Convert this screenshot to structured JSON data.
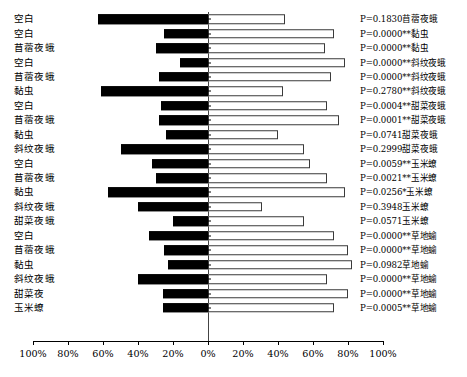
{
  "chart_data": {
    "type": "bar",
    "orientation": "horizontal",
    "subtype": "diverging-bidirectional",
    "title": "",
    "xlabel": "",
    "ylabel": "",
    "xlim": [
      -100,
      100
    ],
    "grid": false,
    "legend": "none",
    "axis_tick_labels": [
      "100%",
      "80%",
      "60%",
      "40%",
      "20%",
      "0%",
      "20%",
      "40%",
      "60%",
      "80%",
      "100%"
    ],
    "axis_tick_values": [
      -100,
      -80,
      -60,
      -40,
      -20,
      0,
      20,
      40,
      60,
      80,
      100
    ],
    "series": [
      {
        "name": "left-black",
        "color": "#000000"
      },
      {
        "name": "right-white",
        "color": "#ffffff"
      }
    ],
    "categories": [
      "空白",
      "空白",
      "苜蓿夜蛾",
      "空白",
      "苜蓿夜蛾",
      "黏虫",
      "空白",
      "苜蓿夜蛾",
      "黏虫",
      "斜纹夜蛾",
      "空白",
      "苜蓿夜蛾",
      "黏虫",
      "斜纹夜蛾",
      "甜菜夜蛾",
      "空白",
      "苜蓿夜蛾",
      "黏虫",
      "斜纹夜蛾",
      "甜菜夜",
      "玉米蟟"
    ],
    "annotations": [
      "P=0.1830苜蓿夜蛾",
      "P=0.0000**黏虫",
      "P=0.0000**黏虫",
      "P=0.0000**斜纹夜蛾",
      "P=0.0000**斜纹夜蛾",
      "P=0.2780**斜纹夜蛾",
      "P=0.0004**甜菜夜蛾",
      "P=0.0001**甜菜夜蛾",
      "P=0.0741甜菜夜蛾",
      "P=0.2999甜菜夜蛾",
      "P=0.0059**玉米蟟",
      "P=0.0021**玉米蟟",
      "P=0.0256*玉米蟟",
      "P=0.3948玉米蟟",
      "P=0.0571玉米蟟",
      "P=0.0000**草地蝓",
      "P=0.0000**草地蝓",
      "P=0.0982草地蝓",
      "P=0.0000**草地蝓",
      "P=0.0000**草地蝓",
      "P=0.0005**草地蝓"
    ],
    "left_values": [
      63,
      25,
      30,
      16,
      28,
      61,
      27,
      28,
      24,
      50,
      32,
      30,
      57,
      40,
      20,
      34,
      25,
      23,
      40,
      26,
      26
    ],
    "right_values": [
      44,
      72,
      67,
      78,
      70,
      43,
      68,
      75,
      40,
      55,
      58,
      68,
      78,
      31,
      55,
      72,
      80,
      82,
      68,
      80,
      72
    ]
  }
}
